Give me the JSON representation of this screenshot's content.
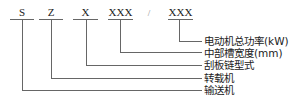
{
  "diagram": {
    "type": "model-code-breakdown",
    "codes": [
      {
        "id": "s",
        "text": "S"
      },
      {
        "id": "z",
        "text": "Z"
      },
      {
        "id": "x",
        "text": "X"
      },
      {
        "id": "xxx1",
        "text": "XXX"
      },
      {
        "id": "sep",
        "text": "/"
      },
      {
        "id": "xxx2",
        "text": "XXX"
      }
    ],
    "labels": [
      {
        "code": "xxx2",
        "text": "电动机总功率(kW)"
      },
      {
        "code": "xxx1",
        "text": "中部槽宽度(mm)"
      },
      {
        "code": "x",
        "text": "刮板链型式"
      },
      {
        "code": "z",
        "text": "转载机"
      },
      {
        "code": "s",
        "text": "输送机"
      }
    ],
    "line_color": "#555555"
  }
}
